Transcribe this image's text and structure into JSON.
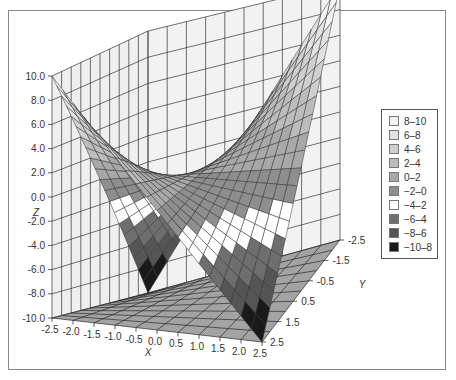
{
  "chart_data": {
    "type": "surface",
    "title": "",
    "xlabel": "X",
    "ylabel": "Y",
    "zlabel": "Z",
    "x_ticks": [
      "-2.5",
      "-2.0",
      "-1.5",
      "-1.0",
      "-0.5",
      "0.0",
      "0.5",
      "1.0",
      "1.5",
      "2.0",
      "2.5"
    ],
    "y_ticks": [
      "-2.5",
      "-1.5",
      "-0.5",
      "0.5",
      "1.5",
      "2.5"
    ],
    "z_ticks": [
      "10.0",
      "8.0",
      "6.0",
      "4.0",
      "2.0",
      "0.0",
      "-2.0",
      "-4.0",
      "-6.0",
      "-8.0",
      "-10.0"
    ],
    "xlim": [
      -2.5,
      2.5
    ],
    "ylim": [
      -2.5,
      2.5
    ],
    "zlim": [
      -10,
      10
    ],
    "function_description": "saddle surface (hyperbolic paraboloid), z ≈ -1.6·x·y",
    "grid": true,
    "legend_position": "right",
    "legend": [
      {
        "label": "8–10",
        "color": "#f4f4f4"
      },
      {
        "label": "6–8",
        "color": "#e2e2e2"
      },
      {
        "label": "4–6",
        "color": "#cfcfcf"
      },
      {
        "label": "2–4",
        "color": "#bcbcbc"
      },
      {
        "label": "0–2",
        "color": "#a8a8a8"
      },
      {
        "label": "−2–0",
        "color": "#8e8e8e"
      },
      {
        "label": "−4–2",
        "color": "#ffffff"
      },
      {
        "label": "−6–4",
        "color": "#6e6e6e"
      },
      {
        "label": "−8–6",
        "color": "#555555"
      },
      {
        "label": "−10–8",
        "color": "#1a1a1a"
      }
    ]
  }
}
